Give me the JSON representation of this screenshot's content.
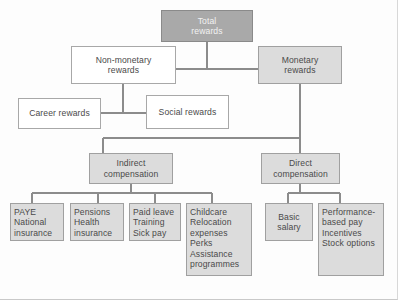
{
  "diagram": {
    "type": "hierarchy-tree",
    "colors": {
      "root_fill": "#a9a9a9",
      "branch_fill": "#dcdcdc",
      "white_fill": "#ffffff",
      "border": "#9a9a9a",
      "line": "#8c8c8c",
      "text": "#4a4a4a",
      "background": "#fdfdfd"
    },
    "nodes": {
      "total_rewards": {
        "label": "Total rewards",
        "lines": [
          "Total",
          "rewards"
        ],
        "fill": "root_fill",
        "align": "center"
      },
      "non_monetary": {
        "label": "Non-monetary rewards",
        "lines": [
          "Non-monetary",
          "rewards"
        ],
        "fill": "white_fill",
        "align": "center"
      },
      "monetary": {
        "label": "Monetary rewards",
        "lines": [
          "Monetary",
          "rewards"
        ],
        "fill": "branch_fill",
        "align": "center"
      },
      "career": {
        "label": "Career rewards",
        "lines": [
          "Career rewards"
        ],
        "fill": "white_fill",
        "align": "center"
      },
      "social": {
        "label": "Social rewards",
        "lines": [
          "Social rewards"
        ],
        "fill": "white_fill",
        "align": "center"
      },
      "indirect": {
        "label": "Indirect compensation",
        "lines": [
          "Indirect",
          "compensation"
        ],
        "fill": "branch_fill",
        "align": "center"
      },
      "direct": {
        "label": "Direct compensation",
        "lines": [
          "Direct",
          "compensation"
        ],
        "fill": "branch_fill",
        "align": "center"
      },
      "paye": {
        "label": "PAYE National insurance",
        "lines": [
          "PAYE",
          "National",
          "insurance"
        ],
        "fill": "branch_fill",
        "align": "left"
      },
      "pensions": {
        "label": "Pensions Health insurance",
        "lines": [
          "Pensions",
          "Health",
          "insurance"
        ],
        "fill": "branch_fill",
        "align": "left"
      },
      "paid_leave": {
        "label": "Paid leave Training Sick pay",
        "lines": [
          "Paid leave",
          "Training",
          "Sick pay"
        ],
        "fill": "branch_fill",
        "align": "left"
      },
      "childcare": {
        "label": "Childcare Relocation expenses Perks Assistance programmes",
        "lines": [
          "Childcare",
          "Relocation",
          "expenses",
          "Perks",
          "Assistance",
          "programmes"
        ],
        "fill": "branch_fill",
        "align": "left"
      },
      "basic_salary": {
        "label": "Basic salary",
        "lines": [
          "Basic",
          "salary"
        ],
        "fill": "branch_fill",
        "align": "center"
      },
      "performance": {
        "label": "Performance-based pay Incentives Stock options",
        "lines": [
          "Performance-",
          "based pay",
          "Incentives",
          "Stock options"
        ],
        "fill": "branch_fill",
        "align": "left"
      }
    },
    "edges": [
      {
        "from": "total_rewards",
        "to": "non_monetary"
      },
      {
        "from": "total_rewards",
        "to": "monetary"
      },
      {
        "from": "non_monetary",
        "to": "career"
      },
      {
        "from": "non_monetary",
        "to": "social"
      },
      {
        "from": "monetary",
        "to": "indirect"
      },
      {
        "from": "monetary",
        "to": "direct"
      },
      {
        "from": "indirect",
        "to": "paye"
      },
      {
        "from": "indirect",
        "to": "pensions"
      },
      {
        "from": "indirect",
        "to": "paid_leave"
      },
      {
        "from": "indirect",
        "to": "childcare"
      },
      {
        "from": "direct",
        "to": "basic_salary"
      },
      {
        "from": "direct",
        "to": "performance"
      }
    ]
  }
}
